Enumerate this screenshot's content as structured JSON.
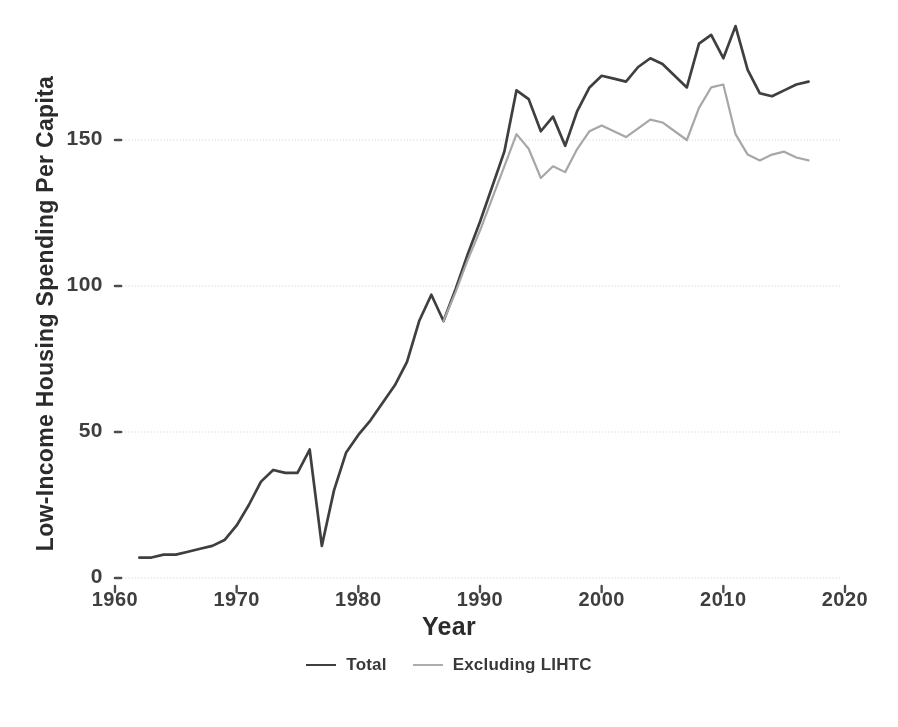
{
  "chart_data": {
    "type": "line",
    "title": "",
    "xlabel": "Year",
    "ylabel": "Low-Income Housing Spending Per Capita",
    "xlim": [
      1960,
      2020
    ],
    "ylim": [
      0,
      160
    ],
    "xticks": [
      1960,
      1970,
      1980,
      1990,
      2000,
      2010,
      2020
    ],
    "yticks": [
      0,
      50,
      100,
      150
    ],
    "grid": "horizontal-dotted",
    "legend_position": "bottom-center",
    "series": [
      {
        "name": "Total",
        "color": "#3b3b3b",
        "x": [
          1962,
          1963,
          1964,
          1965,
          1966,
          1967,
          1968,
          1969,
          1970,
          1971,
          1972,
          1973,
          1974,
          1975,
          1976,
          1977,
          1978,
          1979,
          1980,
          1981,
          1982,
          1983,
          1984,
          1985,
          1986,
          1987,
          1988,
          1989,
          1990,
          1991,
          1992,
          1993,
          1994,
          1995,
          1996,
          1997,
          1998,
          1999,
          2000,
          2001,
          2002,
          2003,
          2004,
          2005,
          2006,
          2007,
          2008,
          2009,
          2010,
          2011,
          2012,
          2013,
          2014,
          2015,
          2016,
          2017
        ],
        "values": [
          7,
          7,
          8,
          8,
          9,
          10,
          11,
          13,
          18,
          25,
          33,
          37,
          36,
          36,
          44,
          11,
          30,
          43,
          49,
          54,
          60,
          66,
          74,
          88,
          97,
          88,
          99,
          111,
          122,
          134,
          146,
          167,
          164,
          153,
          158,
          148,
          160,
          168,
          172,
          171,
          170,
          175,
          178,
          176,
          172,
          168,
          183,
          186,
          178,
          189,
          174,
          166,
          165,
          167,
          169,
          170
        ]
      },
      {
        "name": "Excluding LIHTC",
        "color": "#a9a9a9",
        "x": [
          1987,
          1988,
          1989,
          1990,
          1991,
          1992,
          1993,
          1994,
          1995,
          1996,
          1997,
          1998,
          1999,
          2000,
          2001,
          2002,
          2003,
          2004,
          2005,
          2006,
          2007,
          2008,
          2009,
          2010,
          2011,
          2012,
          2013,
          2014,
          2015,
          2016,
          2017
        ],
        "values": [
          88,
          98,
          109,
          119,
          130,
          141,
          152,
          147,
          137,
          141,
          139,
          147,
          153,
          155,
          153,
          151,
          154,
          157,
          156,
          153,
          150,
          161,
          168,
          169,
          152,
          145,
          143,
          145,
          146,
          144,
          143
        ]
      }
    ]
  },
  "axis": {
    "y_title": "Low-Income Housing Spending Per Capita",
    "x_title": "Year",
    "y_tick_labels": [
      "150",
      "100",
      "50",
      "0"
    ],
    "x_tick_labels": [
      "1960",
      "1970",
      "1980",
      "1990",
      "2000",
      "2010",
      "2020"
    ]
  },
  "legend": {
    "items": [
      {
        "label": "Total",
        "color": "#3b3b3b"
      },
      {
        "label": "Excluding LIHTC",
        "color": "#b0b0b0"
      }
    ]
  }
}
